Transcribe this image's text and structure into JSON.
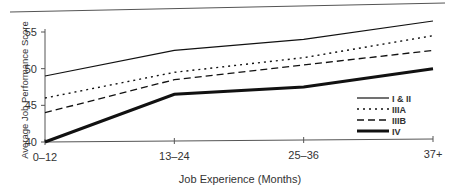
{
  "chart_data": {
    "type": "line",
    "title": "",
    "xlabel": "Job Experience (Months)",
    "ylabel": "Average Job Performance Score",
    "categories": [
      "0–12",
      "13–24",
      "25–36",
      "37+"
    ],
    "ylim": [
      40,
      55
    ],
    "yticks": [
      40,
      45,
      50,
      55
    ],
    "grid": false,
    "legend_position": "lower right inside",
    "series": [
      {
        "name": "I & II",
        "style": "solid-thin",
        "values": [
          49,
          52.5,
          54,
          56.5
        ]
      },
      {
        "name": "IIIA",
        "style": "dotted",
        "values": [
          46,
          49.5,
          51.5,
          54.5
        ]
      },
      {
        "name": "IIIB",
        "style": "dashed",
        "values": [
          44,
          48.5,
          50.5,
          52.5
        ]
      },
      {
        "name": "IV",
        "style": "solid-thick",
        "values": [
          40,
          46.5,
          47.5,
          50
        ]
      }
    ]
  }
}
